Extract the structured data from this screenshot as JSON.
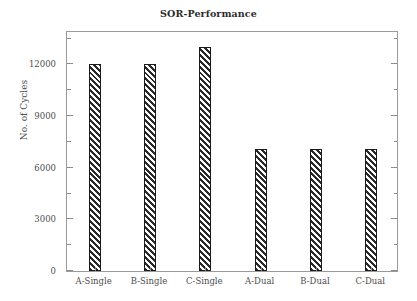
{
  "chart_data": {
    "type": "bar",
    "title": "SOR-Performance",
    "xlabel": "",
    "ylabel": "No. of Cycles",
    "categories": [
      "A-Single",
      "B-Single",
      "C-Single",
      "A-Dual",
      "B-Dual",
      "C-Dual"
    ],
    "values": [
      12000,
      12000,
      13000,
      7100,
      7100,
      7100
    ],
    "ylim": [
      0,
      14000
    ],
    "yticks": [
      0,
      3000,
      6000,
      9000,
      12000
    ],
    "ytick_labels": [
      "0",
      "3000",
      "6000",
      "9000",
      "12000"
    ],
    "yminor_ticks": [
      1500,
      4500,
      7500,
      10500,
      13500
    ],
    "grid": false,
    "legend": null,
    "bar_fill": "diagonal-hatch",
    "bar_edge_color": "#1a1a1a",
    "hatch_color": "#2a2a2a",
    "frame_color": "#9a9a9a",
    "text_color": "#4d4d4d"
  }
}
